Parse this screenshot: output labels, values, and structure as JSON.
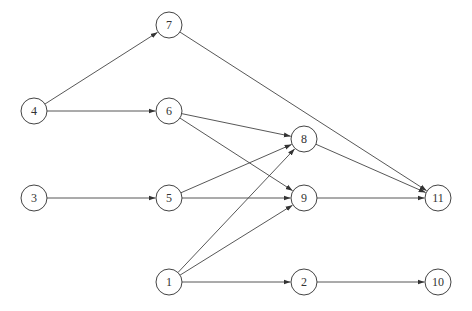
{
  "diagram": {
    "type": "directed-graph",
    "node_radius": 13,
    "stroke_color": "#444444",
    "nodes": [
      {
        "id": "1",
        "label": "1",
        "x": 169,
        "y": 282
      },
      {
        "id": "2",
        "label": "2",
        "x": 304,
        "y": 282
      },
      {
        "id": "3",
        "label": "3",
        "x": 34,
        "y": 198
      },
      {
        "id": "4",
        "label": "4",
        "x": 34,
        "y": 111
      },
      {
        "id": "5",
        "label": "5",
        "x": 169,
        "y": 198
      },
      {
        "id": "6",
        "label": "6",
        "x": 169,
        "y": 111
      },
      {
        "id": "7",
        "label": "7",
        "x": 169,
        "y": 25
      },
      {
        "id": "8",
        "label": "8",
        "x": 304,
        "y": 139
      },
      {
        "id": "9",
        "label": "9",
        "x": 304,
        "y": 198
      },
      {
        "id": "10",
        "label": "10",
        "x": 438,
        "y": 282
      },
      {
        "id": "11",
        "label": "11",
        "x": 438,
        "y": 198
      }
    ],
    "edges": [
      {
        "from": "4",
        "to": "7"
      },
      {
        "from": "4",
        "to": "6"
      },
      {
        "from": "7",
        "to": "11"
      },
      {
        "from": "6",
        "to": "8"
      },
      {
        "from": "6",
        "to": "9"
      },
      {
        "from": "3",
        "to": "5"
      },
      {
        "from": "5",
        "to": "8"
      },
      {
        "from": "5",
        "to": "9"
      },
      {
        "from": "1",
        "to": "8"
      },
      {
        "from": "1",
        "to": "9"
      },
      {
        "from": "1",
        "to": "2"
      },
      {
        "from": "8",
        "to": "11"
      },
      {
        "from": "9",
        "to": "11"
      },
      {
        "from": "2",
        "to": "10"
      }
    ]
  }
}
